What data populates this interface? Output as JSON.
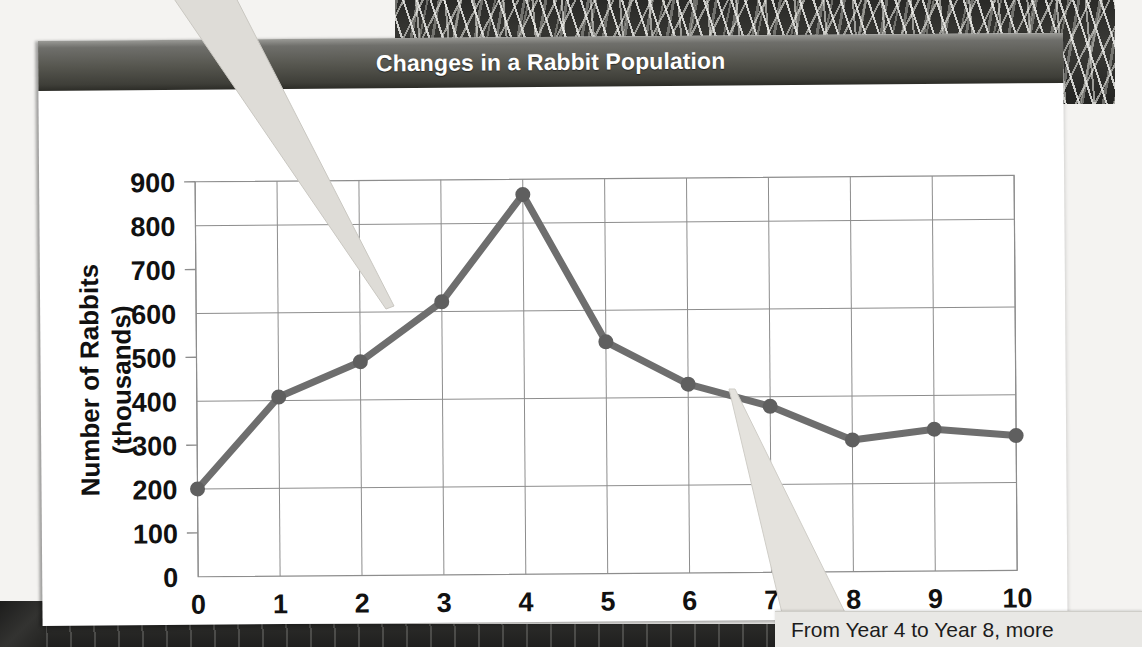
{
  "figure": {
    "title": "Changes in a Rabbit Population",
    "caption": "From Year 4 to Year 8, more"
  },
  "chart_data": {
    "type": "line",
    "title": "Changes in a Rabbit Population",
    "xlabel": "Year of Study",
    "ylabel": "Number of Rabbits (thousands)",
    "x": [
      0,
      1,
      2,
      3,
      4,
      5,
      6,
      7,
      8,
      9,
      10
    ],
    "values": [
      200,
      408,
      487,
      622,
      865,
      528,
      430,
      378,
      300,
      323,
      307
    ],
    "series": [
      {
        "name": "Number of Rabbits (thousands)",
        "values": [
          200,
          408,
          487,
          622,
          865,
          528,
          430,
          378,
          300,
          323,
          307
        ]
      }
    ],
    "xlim": [
      0,
      10
    ],
    "ylim": [
      0,
      900
    ],
    "xticks": [
      "0",
      "1",
      "2",
      "3",
      "4",
      "5",
      "6",
      "7",
      "8",
      "9",
      "10"
    ],
    "yticks": [
      "0",
      "100",
      "200",
      "300",
      "400",
      "500",
      "600",
      "700",
      "800",
      "900"
    ],
    "y_major_gridlines": [
      0,
      200,
      400,
      600,
      800
    ],
    "y_minor_ticks": [
      100,
      300,
      500,
      700,
      900
    ],
    "x_gridlines": [
      0,
      1,
      2,
      3,
      4,
      5,
      6,
      7,
      8,
      9,
      10
    ],
    "grid": true,
    "legend": "none",
    "line_color": "#6e6e6e",
    "marker_color": "#5f5f5f",
    "marker": "circle",
    "axis_color": "#8d8d8d",
    "text_color": "#111111"
  },
  "axes": {
    "y_title_line1": "Number of Rabbits",
    "y_title_line2": "(thousands)",
    "x_title": "Year of Study"
  },
  "colors": {
    "header_bar": "#56564f",
    "panel": "#ffffff",
    "callout": "#dedcd7",
    "caption_bg": "#e9e8e5",
    "line": "#6e6e6e"
  }
}
